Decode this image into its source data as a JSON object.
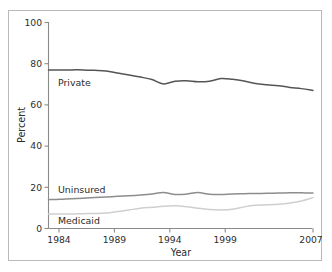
{
  "figure": {
    "frame_color": "#b9b9b9",
    "background": "#ffffff"
  },
  "axes": {
    "y_title": "Percent",
    "x_title": "Year",
    "y_ticks": [
      "0",
      "20",
      "40",
      "60",
      "80",
      "100"
    ],
    "x_ticks": [
      "1984",
      "1989",
      "1994",
      "1999",
      "2007"
    ]
  },
  "labels": {
    "private": "Private",
    "uninsured": "Uninsured",
    "medicaid": "Medicaid"
  },
  "colors": {
    "private": "#555555",
    "uninsured": "#8d8d8d",
    "medicaid": "#cfcfcf",
    "axis": "#8a8a8a",
    "text": "#2b2b2b"
  },
  "chart_data": {
    "type": "line",
    "title": "",
    "xlabel": "Year",
    "ylabel": "Percent",
    "xlim": [
      1984,
      2007
    ],
    "ylim": [
      0,
      100
    ],
    "grid": false,
    "legend": "inline-labels",
    "x": [
      1984,
      1985,
      1986,
      1987,
      1988,
      1989,
      1990,
      1991,
      1992,
      1993,
      1994,
      1995,
      1996,
      1997,
      1998,
      1999,
      2000,
      2001,
      2002,
      2003,
      2004,
      2005,
      2006,
      2007
    ],
    "series": [
      {
        "name": "Private",
        "color": "#555555",
        "values": [
          77.0,
          77.0,
          77.0,
          77.0,
          76.8,
          76.5,
          75.5,
          74.5,
          73.5,
          72.3,
          70.2,
          71.5,
          71.7,
          71.2,
          71.5,
          72.8,
          72.4,
          71.6,
          70.4,
          69.8,
          69.3,
          68.5,
          67.9,
          67.0
        ]
      },
      {
        "name": "Uninsured",
        "color": "#8d8d8d",
        "values": [
          14.0,
          14.2,
          14.5,
          14.7,
          15.0,
          15.3,
          15.6,
          15.9,
          16.3,
          16.8,
          17.5,
          16.5,
          16.7,
          17.5,
          16.6,
          16.5,
          16.8,
          16.9,
          17.0,
          17.1,
          17.2,
          17.3,
          17.3,
          17.2
        ]
      },
      {
        "name": "Medicaid",
        "color": "#cfcfcf",
        "values": [
          7.0,
          7.0,
          7.0,
          7.2,
          7.3,
          7.5,
          8.2,
          9.0,
          9.8,
          10.3,
          10.8,
          11.0,
          10.6,
          9.8,
          9.2,
          9.0,
          9.3,
          10.5,
          11.3,
          11.5,
          11.8,
          12.4,
          13.4,
          15.0
        ]
      }
    ]
  }
}
